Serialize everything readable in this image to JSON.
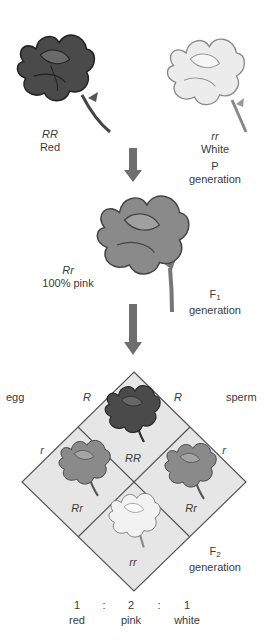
{
  "colors": {
    "red_flower": "#4a4a4a",
    "red_flower_dark": "#2a2a2a",
    "pink_flower": "#8a8a8a",
    "pink_flower_dark": "#5a5a5a",
    "white_flower": "#e4e4e4",
    "white_flower_stroke": "#8a8a8a",
    "arrow": "#6e6e6e",
    "punnett_fill": "#e6e6e6",
    "punnett_stroke": "#555555",
    "text": "#3a3a3a"
  },
  "parents": {
    "red": {
      "genotype": "RR",
      "phenotype": "Red"
    },
    "white": {
      "genotype": "rr",
      "phenotype": "White"
    },
    "generation_letter": "P",
    "generation_word": "generation"
  },
  "f1": {
    "genotype": "Rr",
    "phenotype": "100% pink",
    "generation_letter": "F",
    "generation_sub": "1",
    "generation_word": "generation"
  },
  "punnett": {
    "egg_label": "egg",
    "sperm_label": "sperm",
    "egg_alleles": [
      "R",
      "r"
    ],
    "sperm_alleles": [
      "R",
      "r"
    ],
    "cells": [
      {
        "position": "top",
        "genotype": "RR",
        "color": "red"
      },
      {
        "position": "left",
        "genotype": "Rr",
        "color": "pink"
      },
      {
        "position": "right",
        "genotype": "Rr",
        "color": "pink"
      },
      {
        "position": "bottom",
        "genotype": "rr",
        "color": "white"
      }
    ]
  },
  "f2": {
    "generation_letter": "F",
    "generation_sub": "2",
    "generation_word": "generation",
    "ratio": [
      {
        "count": "1",
        "label": "red"
      },
      {
        "count": "2",
        "label": "pink"
      },
      {
        "count": "1",
        "label": "white"
      }
    ],
    "separator": ":"
  }
}
